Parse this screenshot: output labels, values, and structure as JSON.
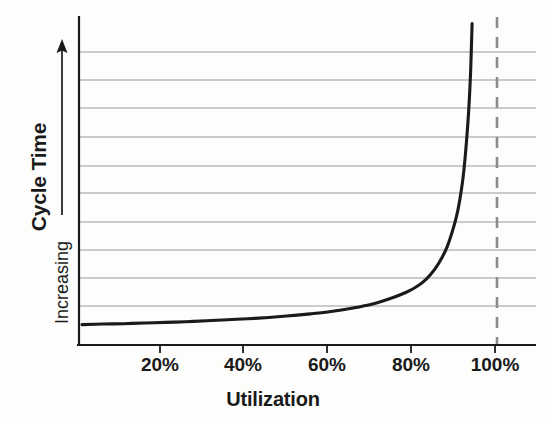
{
  "chart_data": {
    "type": "line",
    "title": "",
    "xlabel": "Utilization",
    "ylabel": "Cycle Time",
    "ylabel_secondary": "Increasing",
    "xlim": [
      0,
      105
    ],
    "ylim": [
      0,
      10
    ],
    "xticks": [
      20,
      40,
      60,
      80,
      100
    ],
    "xtick_labels": [
      "20%",
      "40%",
      "60%",
      "80%",
      "100%"
    ],
    "ytick_labels": [],
    "grid": "horizontal",
    "legend": "none",
    "annotations": [
      {
        "name": "capacity-limit-line",
        "kind": "vertical-dashed-line",
        "x": 100,
        "label": "",
        "color": "#8c8c8c"
      },
      {
        "name": "increasing-arrow",
        "kind": "upward-arrow",
        "label": "Increasing",
        "color": "#1a1a1a"
      }
    ],
    "series": [
      {
        "name": "Cycle Time vs Utilization",
        "color": "#1a1a1a",
        "x": [
          0,
          5,
          10,
          15,
          20,
          25,
          30,
          35,
          40,
          45,
          50,
          55,
          60,
          65,
          70,
          75,
          78,
          80,
          82,
          84,
          86,
          88,
          90,
          91,
          92,
          93,
          93.6,
          94
        ],
        "y": [
          0.62,
          0.64,
          0.65,
          0.67,
          0.69,
          0.71,
          0.74,
          0.77,
          0.8,
          0.84,
          0.89,
          0.95,
          1.02,
          1.12,
          1.25,
          1.45,
          1.6,
          1.73,
          1.9,
          2.15,
          2.5,
          3.0,
          3.8,
          4.4,
          5.3,
          6.8,
          8.2,
          9.8
        ]
      }
    ],
    "gridline_y_values": [
      9.0,
      8.1,
      7.2,
      6.35,
      5.45,
      4.6,
      3.7,
      2.85,
      1.95,
      1.1
    ]
  },
  "axes": {
    "x_title": "Utilization",
    "y_title": "Cycle Time",
    "y_subtitle": "Increasing",
    "x_tick_labels": [
      "20%",
      "40%",
      "60%",
      "80%",
      "100%"
    ]
  },
  "colors": {
    "curve": "#1a1a1a",
    "axis": "#1a1a1a",
    "gridline": "#999999",
    "dashed_limit": "#8c8c8c",
    "text": "#1a1a1a",
    "background": "#fdfdfc"
  }
}
